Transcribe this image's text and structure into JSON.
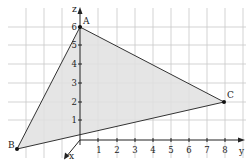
{
  "diagram": {
    "type": "3d-coordinate-triangle",
    "axes": {
      "z": {
        "label": "z",
        "ticks": [
          "1",
          "2",
          "3",
          "4",
          "5",
          "6"
        ]
      },
      "y": {
        "label": "y",
        "ticks": [
          "1",
          "2",
          "3",
          "4",
          "5",
          "6",
          "7",
          "8"
        ]
      },
      "x": {
        "label": "x"
      }
    },
    "points": {
      "A": {
        "label": "A",
        "coords": [
          0,
          0,
          6
        ]
      },
      "B": {
        "label": "B"
      },
      "C": {
        "label": "C",
        "coords": [
          0,
          8,
          2
        ]
      }
    },
    "colors": {
      "grid": "#c8c8c8",
      "fill": "#e0e0e0",
      "stroke": "#333333",
      "axis": "#222222"
    }
  }
}
